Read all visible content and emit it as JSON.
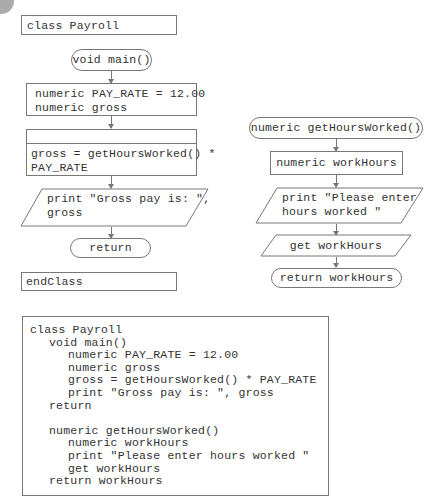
{
  "left_flowchart": {
    "class_header": "class Payroll",
    "main_terminal": "void main()",
    "declarations": [
      "numeric PAY_RATE = 12.00",
      "numeric gross"
    ],
    "predefined_process": [
      "gross = getHoursWorked() *",
      "PAY_RATE"
    ],
    "output": [
      "print \"Gross pay is: \",",
      "gross"
    ],
    "return_terminal": "return",
    "class_footer": "endClass"
  },
  "right_flowchart": {
    "method_terminal": "numeric getHoursWorked()",
    "declaration": "numeric workHours",
    "output": [
      "print \"Please enter",
      "hours worked \""
    ],
    "input": "get workHours",
    "return_terminal": "return workHours"
  },
  "pseudocode": {
    "lines": [
      {
        "indent": 0,
        "text": "class Payroll"
      },
      {
        "indent": 1,
        "text": "void main()"
      },
      {
        "indent": 2,
        "text": "numeric PAY_RATE = 12.00"
      },
      {
        "indent": 2,
        "text": "numeric gross"
      },
      {
        "indent": 2,
        "text": "gross = getHoursWorked() * PAY_RATE"
      },
      {
        "indent": 2,
        "text": "print \"Gross pay is: \", gross"
      },
      {
        "indent": 1,
        "text": "return"
      },
      {
        "indent": 0,
        "text": ""
      },
      {
        "indent": 1,
        "text": "numeric getHoursWorked()"
      },
      {
        "indent": 2,
        "text": "numeric workHours"
      },
      {
        "indent": 2,
        "text": "print \"Please enter hours worked \""
      },
      {
        "indent": 2,
        "text": "get workHours"
      },
      {
        "indent": 1,
        "text": "return workHours"
      }
    ]
  }
}
